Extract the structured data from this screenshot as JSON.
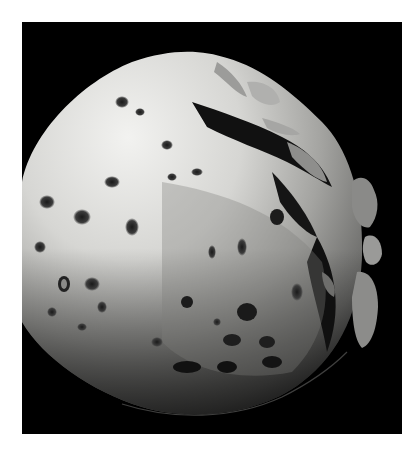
{
  "image": {
    "subject": "grayscale photograph of a cratered moon against black space",
    "width": 417,
    "height": 449,
    "border_color": "#ffffff",
    "background_color": "#000000"
  },
  "colors": {
    "space": "#000000",
    "highlight": "#e8e8e6",
    "midtone": "#9a9a98",
    "shadow": "#3a3a3a"
  },
  "features": [
    {
      "name": "bright-limb",
      "description": "sunlit upper-left hemisphere"
    },
    {
      "name": "terminator",
      "description": "shadowed lower-right edge with rough ridges"
    },
    {
      "name": "ridge-outcrops",
      "description": "detached lit highlands near right terminator"
    },
    {
      "name": "craters",
      "description": "scattered dark crater pits across the surface"
    }
  ]
}
